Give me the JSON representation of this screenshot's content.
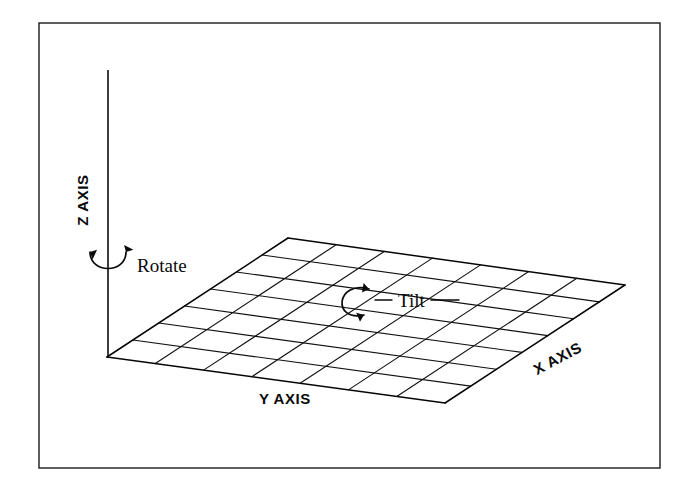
{
  "figure": {
    "background_color": "#ffffff",
    "ink_color": "#0a0a0a",
    "border": {
      "name": "figure-frame",
      "x": 39,
      "y": 23,
      "width": 621,
      "height": 445,
      "color": "#1a1a1a"
    }
  },
  "axes": {
    "z": {
      "label": "Z AXIS",
      "orientation": "vertical",
      "label_rotation_deg": -90,
      "line": {
        "x1": 108,
        "y1": 70,
        "x2": 108,
        "y2": 357
      },
      "label_position": {
        "x": 88,
        "y": 200
      }
    },
    "x": {
      "label": "X AXIS",
      "orientation": "receding-right",
      "label_rotation_deg": -28,
      "label_position": {
        "x": 560,
        "y": 363
      }
    },
    "y": {
      "label": "Y AXIS",
      "orientation": "horizontal",
      "label_rotation_deg": 0,
      "label_position": {
        "x": 285,
        "y": 404
      }
    }
  },
  "grid": {
    "name": "ground-plane-grid",
    "divisions_x": 7,
    "divisions_y": 7,
    "corners": {
      "origin": {
        "x": 107,
        "y": 357
      },
      "top": {
        "x": 288,
        "y": 238
      },
      "right": {
        "x": 625,
        "y": 285
      },
      "bottom": {
        "x": 445,
        "y": 403
      }
    },
    "line_color": "#111111"
  },
  "annotations": [
    {
      "id": "rotate",
      "label": "Rotate",
      "type": "curved-double-arrow",
      "describes": "rotation about the Z axis",
      "label_position": {
        "x": 137,
        "y": 272
      },
      "arrow_center": {
        "x": 108,
        "y": 258
      }
    },
    {
      "id": "tilt",
      "label": "Tilt",
      "type": "curved-double-arrow",
      "describes": "tilt of the ground plane",
      "label_position": {
        "x": 398,
        "y": 305
      },
      "arrow_center": {
        "x": 355,
        "y": 300
      }
    }
  ]
}
